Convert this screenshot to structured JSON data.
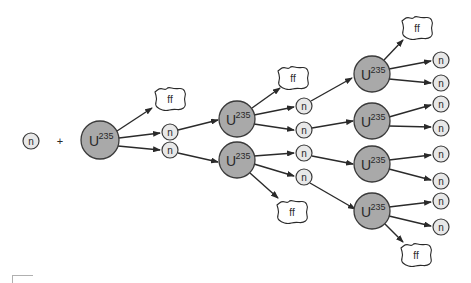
{
  "diagram": {
    "colors": {
      "uranium_fill": "#a9a9a9",
      "uranium_stroke": "#3a3a3a",
      "neutron_fill": "#e8e8e8",
      "neutron_stroke": "#3a3a3a",
      "cloud_fill": "#ffffff",
      "cloud_stroke": "#2a2a2a",
      "arrow": "#2a2a2a"
    },
    "labels": {
      "neutron": "n",
      "uranium_base": "U",
      "uranium_mass": "235",
      "fission_fragment": "ff",
      "plus": "+"
    },
    "incoming_neutron": {
      "x": 31,
      "y": 141
    },
    "plus_sign": {
      "x": 60,
      "y": 141
    },
    "uranium_nuclei": [
      {
        "id": "u0",
        "x": 100,
        "y": 140,
        "r": 19
      },
      {
        "id": "u1a",
        "x": 237,
        "y": 119,
        "r": 18
      },
      {
        "id": "u1b",
        "x": 237,
        "y": 160,
        "r": 18
      },
      {
        "id": "u2a",
        "x": 372,
        "y": 74,
        "r": 18
      },
      {
        "id": "u2b",
        "x": 372,
        "y": 121,
        "r": 18
      },
      {
        "id": "u2c",
        "x": 372,
        "y": 164,
        "r": 18
      },
      {
        "id": "u2d",
        "x": 372,
        "y": 211,
        "r": 18
      }
    ],
    "neutrons": [
      {
        "id": "n1a",
        "x": 170,
        "y": 132
      },
      {
        "id": "n1b",
        "x": 170,
        "y": 150
      },
      {
        "id": "n2a",
        "x": 304,
        "y": 106
      },
      {
        "id": "n2b",
        "x": 304,
        "y": 130
      },
      {
        "id": "n2c",
        "x": 304,
        "y": 153
      },
      {
        "id": "n2d",
        "x": 304,
        "y": 177
      },
      {
        "id": "n3a",
        "x": 441,
        "y": 60
      },
      {
        "id": "n3b",
        "x": 441,
        "y": 83
      },
      {
        "id": "n3c",
        "x": 441,
        "y": 104
      },
      {
        "id": "n3d",
        "x": 441,
        "y": 128
      },
      {
        "id": "n3e",
        "x": 441,
        "y": 154
      },
      {
        "id": "n3f",
        "x": 441,
        "y": 181
      },
      {
        "id": "n3g",
        "x": 441,
        "y": 201
      },
      {
        "id": "n3h",
        "x": 441,
        "y": 227
      }
    ],
    "fission_fragments": [
      {
        "id": "ff0",
        "x": 170,
        "y": 99
      },
      {
        "id": "ff1",
        "x": 293,
        "y": 78
      },
      {
        "id": "ff2",
        "x": 292,
        "y": 212
      },
      {
        "id": "ff3",
        "x": 417,
        "y": 28
      },
      {
        "id": "ff4",
        "x": 416,
        "y": 255
      }
    ],
    "arrows": [
      {
        "from": [
          117,
          131
        ],
        "to": [
          152,
          108
        ]
      },
      {
        "from": [
          119,
          138
        ],
        "to": [
          160,
          133
        ]
      },
      {
        "from": [
          118,
          146
        ],
        "to": [
          160,
          150
        ]
      },
      {
        "from": [
          178,
          130
        ],
        "to": [
          218,
          120
        ]
      },
      {
        "from": [
          178,
          153
        ],
        "to": [
          218,
          162
        ]
      },
      {
        "from": [
          252,
          108
        ],
        "to": [
          280,
          88
        ]
      },
      {
        "from": [
          254,
          115
        ],
        "to": [
          294,
          107
        ]
      },
      {
        "from": [
          254,
          124
        ],
        "to": [
          294,
          130
        ]
      },
      {
        "from": [
          254,
          156
        ],
        "to": [
          294,
          153
        ]
      },
      {
        "from": [
          254,
          164
        ],
        "to": [
          294,
          176
        ]
      },
      {
        "from": [
          250,
          173
        ],
        "to": [
          278,
          198
        ]
      },
      {
        "from": [
          311,
          101
        ],
        "to": [
          352,
          78
        ]
      },
      {
        "from": [
          312,
          128
        ],
        "to": [
          353,
          121
        ]
      },
      {
        "from": [
          312,
          156
        ],
        "to": [
          353,
          164
        ]
      },
      {
        "from": [
          310,
          183
        ],
        "to": [
          355,
          209
        ]
      },
      {
        "from": [
          384,
          60
        ],
        "to": [
          403,
          40
        ]
      },
      {
        "from": [
          389,
          69
        ],
        "to": [
          431,
          61
        ]
      },
      {
        "from": [
          389,
          79
        ],
        "to": [
          431,
          83
        ]
      },
      {
        "from": [
          389,
          117
        ],
        "to": [
          431,
          105
        ]
      },
      {
        "from": [
          389,
          126
        ],
        "to": [
          431,
          127
        ]
      },
      {
        "from": [
          389,
          160
        ],
        "to": [
          431,
          155
        ]
      },
      {
        "from": [
          389,
          169
        ],
        "to": [
          431,
          180
        ]
      },
      {
        "from": [
          389,
          207
        ],
        "to": [
          431,
          202
        ]
      },
      {
        "from": [
          389,
          216
        ],
        "to": [
          431,
          226
        ]
      },
      {
        "from": [
          385,
          224
        ],
        "to": [
          403,
          242
        ]
      }
    ]
  }
}
